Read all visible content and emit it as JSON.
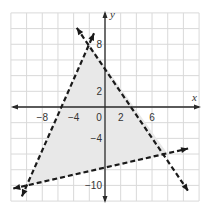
{
  "chart_data": {
    "type": "line",
    "title": "",
    "xlabel": "x",
    "ylabel": "y",
    "xlim": [
      -12,
      12
    ],
    "ylim": [
      -12,
      12
    ],
    "grid": true,
    "grid_step": 2,
    "x_tick_labels": [
      {
        "value": -8,
        "label": "−8"
      },
      {
        "value": -4,
        "label": "−4"
      },
      {
        "value": 0,
        "label": "0"
      },
      {
        "value": 2,
        "label": "2"
      },
      {
        "value": 6,
        "label": "6"
      }
    ],
    "y_tick_labels": [
      {
        "value": 8,
        "label": "8"
      },
      {
        "value": 2,
        "label": "2"
      },
      {
        "value": -4,
        "label": "−4"
      },
      {
        "value": -10,
        "label": "−10"
      }
    ],
    "series": [
      {
        "name": "boundary-line-1",
        "style": "dashed",
        "points": [
          [
            -10.6,
            -11.4
          ],
          [
            -1.4,
            9.4
          ]
        ],
        "description": "line through (-10,-10) and (-2,8)"
      },
      {
        "name": "boundary-line-2",
        "style": "dashed",
        "points": [
          [
            -3.6,
            10.1
          ],
          [
            10.6,
            -10.7
          ]
        ],
        "description": "line through (-2,8) and (8,-6)"
      },
      {
        "name": "boundary-line-3",
        "style": "dashed",
        "points": [
          [
            -11.7,
            -10.4
          ],
          [
            10.6,
            -5.3
          ]
        ],
        "description": "line through (-10,-10) and (8,-6)"
      }
    ],
    "shaded_region": {
      "vertices": [
        [
          -2,
          8
        ],
        [
          8,
          -6
        ],
        [
          -10,
          -10
        ]
      ],
      "fill": "#e8e8e8"
    }
  },
  "labels": {
    "x_axis": "x",
    "y_axis": "y",
    "x_ticks": [
      "−8",
      "−4",
      "0",
      "2",
      "6"
    ],
    "y_ticks": [
      "8",
      "2",
      "−4",
      "−10"
    ]
  },
  "colors": {
    "grid": "#d9d9d9",
    "axis": "#2a2a2a",
    "boundary": "#1a1a1a",
    "region": "#e8e8e8",
    "background": "#ffffff"
  }
}
